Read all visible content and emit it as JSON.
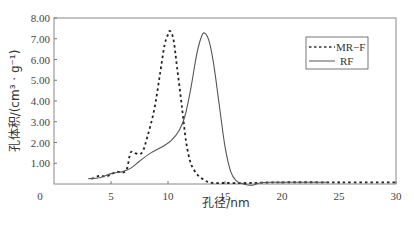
{
  "chart_data": {
    "type": "line",
    "title": "",
    "xlabel": "孔径/nm",
    "ylabel": "孔体积/(cm³ · g⁻¹)",
    "xlim": [
      0,
      30
    ],
    "ylim": [
      0,
      8
    ],
    "x_ticks": [
      "0",
      "5",
      "10",
      "15",
      "20",
      "25",
      "30"
    ],
    "y_ticks": [
      "1.00",
      "2.00",
      "3.00",
      "4.00",
      "5.00",
      "6.00",
      "7.00",
      "8.00"
    ],
    "grid": false,
    "legend_position": "upper right",
    "series": [
      {
        "name": "MR−F",
        "style": "dashed",
        "x": [
          3.3,
          4.0,
          4.5,
          5.0,
          5.5,
          6.0,
          6.4,
          6.7,
          7.0,
          7.7,
          8.2,
          8.8,
          9.3,
          9.7,
          10.0,
          10.2,
          10.5,
          10.8,
          11.2,
          11.6,
          12.0,
          12.5,
          13.0,
          13.5,
          14.0,
          15.0,
          17.0,
          20.0,
          25.0,
          30.0
        ],
        "y": [
          0.25,
          0.4,
          0.35,
          0.45,
          0.6,
          0.55,
          0.75,
          1.5,
          1.5,
          1.5,
          2.3,
          3.6,
          5.3,
          6.7,
          7.2,
          7.37,
          6.9,
          5.6,
          3.8,
          2.0,
          1.0,
          0.5,
          0.25,
          0.1,
          0.05,
          0.05,
          0.05,
          0.08,
          0.08,
          0.08
        ]
      },
      {
        "name": "RF",
        "style": "solid",
        "x": [
          3.0,
          4.0,
          5.0,
          6.0,
          6.7,
          7.5,
          8.5,
          9.5,
          10.3,
          11.0,
          11.5,
          12.0,
          12.5,
          12.9,
          13.2,
          13.6,
          14.0,
          14.5,
          15.0,
          15.5,
          16.0,
          16.5,
          17.0,
          17.5,
          18.0,
          19.0,
          20.0,
          22.0,
          24.0
        ],
        "y": [
          0.25,
          0.3,
          0.5,
          0.6,
          0.75,
          1.1,
          1.5,
          1.8,
          2.1,
          2.6,
          3.3,
          4.6,
          6.2,
          7.05,
          7.28,
          6.9,
          5.8,
          3.8,
          1.8,
          0.6,
          0.15,
          0.02,
          -0.05,
          -0.05,
          0.05,
          0.08,
          0.08,
          0.08,
          0.08
        ]
      }
    ]
  },
  "axes": {
    "x_title": "孔径/nm",
    "y_title": "孔体积/(cm³ · g⁻¹)",
    "origin_label": "0"
  },
  "legend": {
    "items": [
      {
        "label": "MR−F",
        "style": "dashed"
      },
      {
        "label": "RF",
        "style": "solid"
      }
    ]
  },
  "colors": {
    "line": "#333333",
    "axis": "#555555",
    "frame": "#888888"
  }
}
